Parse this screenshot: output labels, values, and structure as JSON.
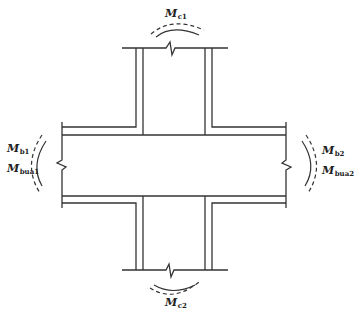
{
  "diagram": {
    "stroke_color": "#333333",
    "labels": {
      "top": {
        "main": "M",
        "sub": "c1"
      },
      "bottom": {
        "main": "M",
        "sub": "c2"
      },
      "left_1": {
        "main": "M",
        "sub": "b1"
      },
      "left_2": {
        "main": "M",
        "sub": "bua1"
      },
      "right_1": {
        "main": "M",
        "sub": "b2"
      },
      "right_2": {
        "main": "M",
        "sub": "bua2"
      }
    }
  }
}
